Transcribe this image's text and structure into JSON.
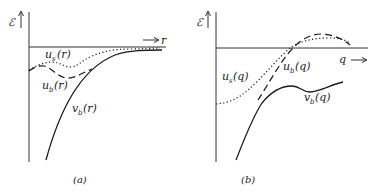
{
  "panels": [
    {
      "id": "a",
      "caption": "(a)",
      "y_axis_label": "ℰ",
      "x_axis_label": "r",
      "curves": [
        {
          "name": "u_s",
          "label_main": "u",
          "label_sub": "s",
          "label_arg": "(r)",
          "style": "dotted"
        },
        {
          "name": "u_b",
          "label_main": "u",
          "label_sub": "b",
          "label_arg": "(r)",
          "style": "dashed"
        },
        {
          "name": "v_b",
          "label_main": "v",
          "label_sub": "b",
          "label_arg": "(r)",
          "style": "solid"
        }
      ]
    },
    {
      "id": "b",
      "caption": "(b)",
      "y_axis_label": "ℰ",
      "x_axis_label": "q",
      "curves": [
        {
          "name": "u_s",
          "label_main": "u",
          "label_sub": "s",
          "label_arg": "(q)",
          "style": "dotted"
        },
        {
          "name": "u_b",
          "label_main": "u",
          "label_sub": "b",
          "label_arg": "(q)",
          "style": "dashed"
        },
        {
          "name": "v_b",
          "label_main": "v",
          "label_sub": "b",
          "label_arg": "(q)",
          "style": "solid"
        }
      ]
    }
  ],
  "colors": {
    "ink": "#1a1a1a",
    "background": "#ffffff"
  }
}
